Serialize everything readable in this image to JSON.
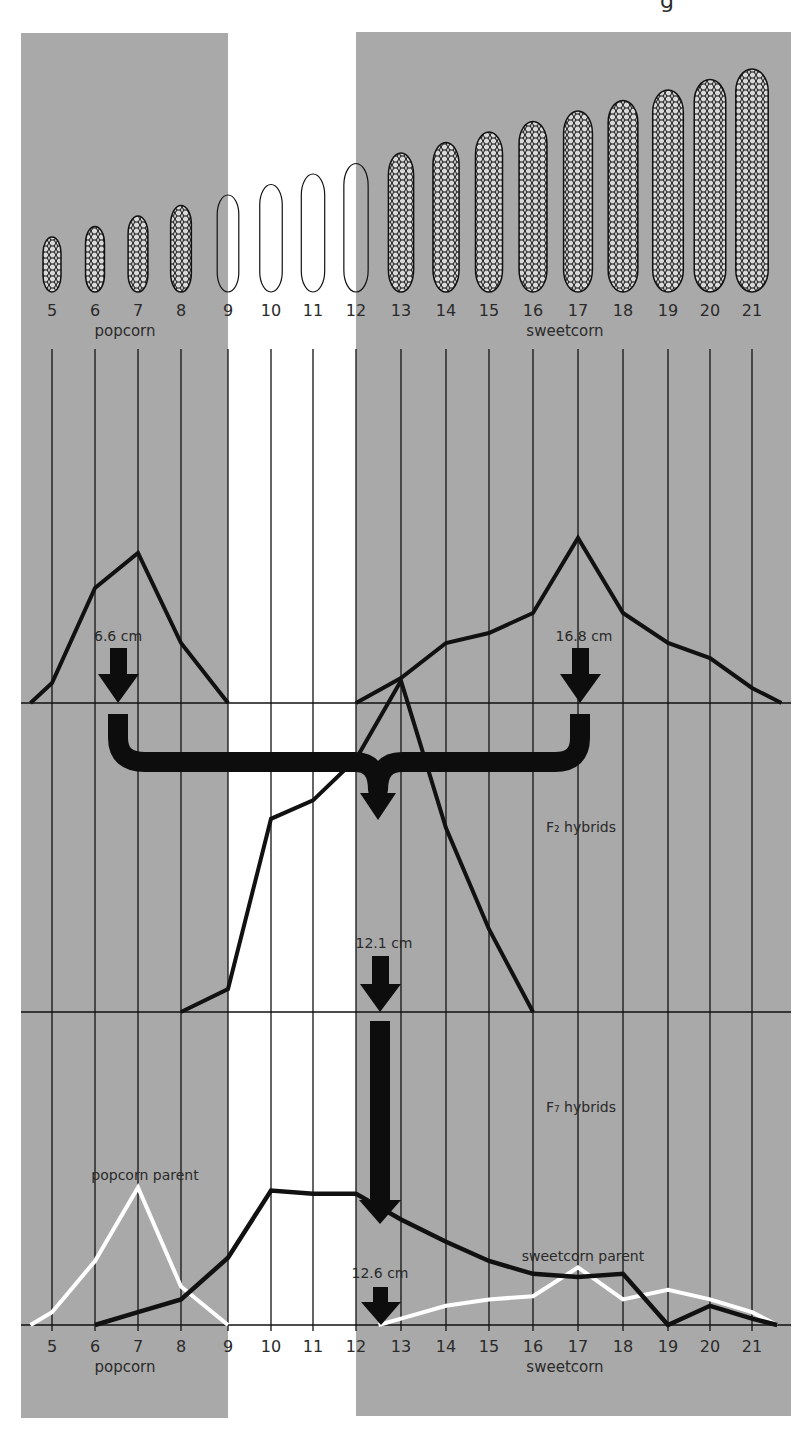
{
  "header_fragment": "g",
  "colors": {
    "panel_gray": "#a9a9a9",
    "line_black": "#111111",
    "parent_white": "#ffffff",
    "text": "#2a2a2a"
  },
  "axis": {
    "ticks": [
      5,
      6,
      7,
      8,
      9,
      10,
      11,
      12,
      13,
      14,
      15,
      16,
      17,
      18,
      19,
      20,
      21
    ],
    "tick_x": [
      52,
      95,
      138,
      181,
      228,
      271,
      313,
      356,
      401,
      446,
      489,
      533,
      578,
      623,
      668,
      710,
      752
    ],
    "unit": "cm",
    "group_labels": {
      "left": "popcorn",
      "right": "sweetcorn"
    }
  },
  "ears": {
    "lengths_cm": [
      5,
      6,
      7,
      8,
      9,
      10,
      11,
      12,
      13,
      14,
      15,
      16,
      17,
      18,
      19,
      20,
      21
    ],
    "outline_only": [
      9,
      10,
      11,
      12
    ]
  },
  "labels": {
    "popcorn_mean": "6.6 cm",
    "sweetcorn_mean": "16.8 cm",
    "f2_title": "F₂ hybrids",
    "f2_mean": "12.1 cm",
    "f7_title": "F₇ hybrids",
    "f7_mean": "12.6 cm",
    "popcorn_parent": "popcorn parent",
    "sweetcorn_parent": "sweetcorn parent"
  },
  "chart_data": [
    {
      "type": "line",
      "title": "Parental ear length distributions",
      "xlabel": "ear length (cm)",
      "ylabel": "relative frequency",
      "x": [
        4.5,
        5,
        6,
        7,
        8,
        9,
        12,
        13,
        14,
        15,
        16,
        17,
        18,
        19,
        20,
        21,
        21.7
      ],
      "series": [
        {
          "name": "popcorn",
          "x": [
            4.5,
            5,
            6,
            7,
            8,
            9
          ],
          "values": [
            0,
            4,
            23,
            30,
            12,
            0
          ]
        },
        {
          "name": "sweetcorn",
          "x": [
            12,
            13,
            14,
            15,
            16,
            17,
            18,
            19,
            20,
            21,
            21.7
          ],
          "values": [
            0,
            5,
            12,
            14,
            18,
            33,
            18,
            12,
            9,
            3,
            0
          ]
        }
      ],
      "annotations": [
        {
          "text": "6.6 cm",
          "x": 6.6
        },
        {
          "text": "16.8 cm",
          "x": 16.8
        }
      ]
    },
    {
      "type": "line",
      "title": "F2 hybrids",
      "xlabel": "ear length (cm)",
      "x": [
        8,
        9,
        10,
        11,
        12,
        13,
        14,
        15,
        16
      ],
      "series": [
        {
          "name": "F2 hybrids",
          "values": [
            0,
            5,
            42,
            46,
            55,
            72,
            40,
            18,
            0
          ]
        }
      ],
      "annotations": [
        {
          "text": "12.1 cm",
          "x": 12.1
        }
      ]
    },
    {
      "type": "line",
      "title": "F7 hybrids",
      "xlabel": "ear length (cm)",
      "x": [
        6,
        7,
        8,
        9,
        10,
        11,
        12,
        13,
        14,
        15,
        16,
        17,
        18,
        19,
        20,
        21,
        21.6
      ],
      "series": [
        {
          "name": "F7 hybrids",
          "values": [
            0,
            4,
            8,
            21,
            42,
            41,
            41,
            33,
            26,
            20,
            16,
            15,
            16,
            0,
            6,
            2,
            0
          ]
        },
        {
          "name": "popcorn parent",
          "x": [
            4.5,
            5,
            6,
            7,
            8,
            9
          ],
          "values": [
            0,
            4,
            20,
            43,
            12,
            0
          ]
        },
        {
          "name": "sweetcorn parent",
          "x": [
            12.5,
            13,
            14,
            15,
            16,
            17,
            18,
            19,
            20,
            21,
            21.6
          ],
          "values": [
            0,
            2,
            6,
            8,
            9,
            18,
            8,
            11,
            8,
            4,
            0
          ]
        }
      ],
      "annotations": [
        {
          "text": "12.6 cm",
          "x": 12.6
        },
        {
          "text": "popcorn parent"
        },
        {
          "text": "sweetcorn parent"
        }
      ]
    }
  ]
}
